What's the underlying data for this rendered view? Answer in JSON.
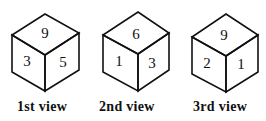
{
  "cubes": [
    {
      "caption": "1st view",
      "top": "6",
      "left": "3",
      "right": "5",
      "top_rotated": true
    },
    {
      "caption": "2nd view",
      "top": "6",
      "left": "1",
      "right": "3",
      "top_rotated": false
    },
    {
      "caption": "3rd view",
      "top": "9",
      "left": "2",
      "right": "1",
      "top_rotated": false
    }
  ],
  "colors": {
    "stroke": "#111111",
    "background": "#ffffff"
  }
}
